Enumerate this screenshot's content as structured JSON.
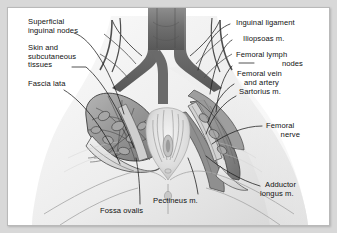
{
  "figure": {
    "style": "grayscale pencil medical illustration",
    "frame_color": "#d8d8d8",
    "background_color": "#ffffff",
    "ink_color": "#111111"
  },
  "labels": {
    "superficial_inguinal_nodes": "Superficial\ninguinal nodes",
    "skin_and_subcutaneous_tissues": "Skin and\nsubcutaneous\ntissues",
    "fascia_lata": "Fascia lata",
    "inguinal_ligament": "Inguinal ligament",
    "iliopsoas": "Iliopsoas m.",
    "femoral_lymph_nodes_line1": "Femoral lymph",
    "femoral_lymph_nodes_line2": "nodes",
    "femoral_vein_and_artery_line1": "Femoral vein",
    "femoral_vein_and_artery_line2": "and artery",
    "sartorius": "Sartorius m.",
    "femoral_nerve_line1": "Femoral",
    "femoral_nerve_line2": "nerve",
    "adductor_longus_line1": "Adductor",
    "adductor_longus_line2": "longus m.",
    "pectineus": "Pectineus m.",
    "fossa_ovalis": "Fossa ovalis"
  },
  "leader_lines": {
    "count": 11,
    "color": "#1a1a1a",
    "width_px": 0.7
  },
  "anatomy_regions": [
    {
      "name": "iliac-vessel-bifurcation",
      "position": "top-center"
    },
    {
      "name": "left-femoral-triangle-node-mass",
      "position": "mid-left"
    },
    {
      "name": "right-femoral-triangle-node-mass",
      "position": "mid-right"
    },
    {
      "name": "perineum",
      "position": "center-low"
    },
    {
      "name": "thigh-left",
      "position": "bottom-left"
    },
    {
      "name": "thigh-right",
      "position": "bottom-right"
    }
  ]
}
